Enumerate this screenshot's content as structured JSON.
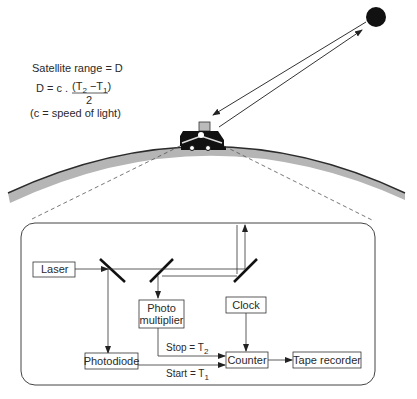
{
  "formula": {
    "line1": "Satellite range = D",
    "lhs": "D = c .",
    "numerator": "(T",
    "num_sub2": "2",
    "num_mid": " −T",
    "num_sub1": "1",
    "num_end": ")",
    "denominator": "2",
    "note": "(c = speed of light)"
  },
  "scene": {
    "satellite": "satellite",
    "vehicle": "laser-ranging-vehicle",
    "earth": "earth-surface"
  },
  "blocks": {
    "laser": "Laser",
    "photo_multiplier_1": "Photo",
    "photo_multiplier_2": "multiplier",
    "clock": "Clock",
    "photodiode": "Photodiode",
    "counter": "Counter",
    "tape_recorder": "Tape  recorder"
  },
  "signals": {
    "stop": "Stop = T",
    "stop_sub": "2",
    "start": "Start = T",
    "start_sub": "1"
  },
  "colors": {
    "line": "#333333",
    "earth_fill": "#b5b5b5",
    "earth_edge": "#2b2b2b",
    "dash": "#555555"
  }
}
